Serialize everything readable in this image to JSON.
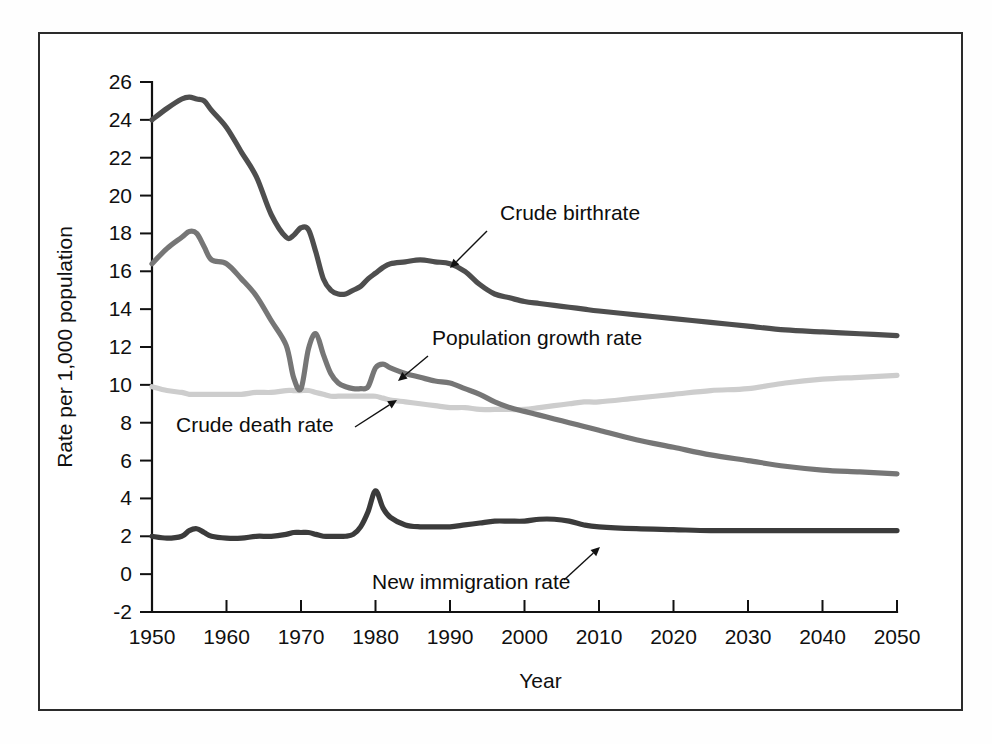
{
  "chart_data": {
    "type": "line",
    "title": "",
    "xlabel": "Year",
    "ylabel": "Rate per 1,000 population",
    "xlim": [
      1950,
      2050
    ],
    "ylim": [
      -2,
      26
    ],
    "grid": false,
    "legend_position": "inline-annotations",
    "xticks": [
      1950,
      1960,
      1970,
      1980,
      1990,
      2000,
      2010,
      2020,
      2030,
      2040,
      2050
    ],
    "xtick_labels": [
      "1950",
      "1960",
      "1970",
      "1980",
      "1990",
      "2000",
      "2010",
      "2020",
      "2030",
      "2040",
      "2050"
    ],
    "yticks": [
      -2,
      0,
      2,
      4,
      6,
      8,
      10,
      12,
      14,
      16,
      18,
      20,
      22,
      24,
      26
    ],
    "ytick_labels": [
      "-2",
      "0",
      "2",
      "4",
      "6",
      "8",
      "10",
      "12",
      "14",
      "16",
      "18",
      "20",
      "22",
      "24",
      "26"
    ],
    "x": [
      1950,
      1952,
      1954,
      1955,
      1956,
      1957,
      1958,
      1960,
      1962,
      1964,
      1966,
      1968,
      1969,
      1970,
      1971,
      1972,
      1973,
      1974,
      1975,
      1976,
      1977,
      1978,
      1979,
      1980,
      1981,
      1982,
      1984,
      1986,
      1988,
      1990,
      1992,
      1994,
      1996,
      1998,
      2000,
      2002,
      2004,
      2006,
      2008,
      2010,
      2015,
      2020,
      2025,
      2030,
      2035,
      2040,
      2045,
      2050
    ],
    "series": [
      {
        "name": "Crude birthrate",
        "color": "#4e4e4e",
        "values": [
          24.0,
          24.6,
          25.1,
          25.2,
          25.1,
          25.0,
          24.5,
          23.6,
          22.3,
          21.0,
          19.0,
          17.8,
          17.9,
          18.3,
          18.2,
          17.0,
          15.6,
          15.0,
          14.8,
          14.8,
          15.0,
          15.2,
          15.6,
          15.9,
          16.2,
          16.4,
          16.5,
          16.6,
          16.5,
          16.4,
          16.0,
          15.3,
          14.8,
          14.6,
          14.4,
          14.3,
          14.2,
          14.1,
          14.0,
          13.9,
          13.7,
          13.5,
          13.3,
          13.1,
          12.9,
          12.8,
          12.7,
          12.6
        ]
      },
      {
        "name": "Population growth rate",
        "color": "#767676",
        "values": [
          16.4,
          17.2,
          17.8,
          18.1,
          18.0,
          17.3,
          16.6,
          16.4,
          15.6,
          14.7,
          13.4,
          12.1,
          10.4,
          9.8,
          11.9,
          12.7,
          11.6,
          10.6,
          10.1,
          9.9,
          9.8,
          9.8,
          9.9,
          10.9,
          11.1,
          10.9,
          10.6,
          10.4,
          10.2,
          10.1,
          9.8,
          9.5,
          9.1,
          8.8,
          8.6,
          8.4,
          8.2,
          8.0,
          7.8,
          7.6,
          7.1,
          6.7,
          6.3,
          6.0,
          5.7,
          5.5,
          5.4,
          5.3
        ]
      },
      {
        "name": "Crude death rate",
        "color": "#cdcdcd",
        "values": [
          9.9,
          9.7,
          9.6,
          9.5,
          9.5,
          9.5,
          9.5,
          9.5,
          9.5,
          9.6,
          9.6,
          9.7,
          9.7,
          9.7,
          9.7,
          9.6,
          9.5,
          9.4,
          9.4,
          9.4,
          9.4,
          9.4,
          9.4,
          9.4,
          9.3,
          9.2,
          9.1,
          9.0,
          8.9,
          8.8,
          8.8,
          8.7,
          8.7,
          8.7,
          8.7,
          8.8,
          8.9,
          9.0,
          9.1,
          9.1,
          9.3,
          9.5,
          9.7,
          9.8,
          10.1,
          10.3,
          10.4,
          10.5
        ]
      },
      {
        "name": "New immigration rate",
        "color": "#3b3b3b",
        "values": [
          2.0,
          1.9,
          2.0,
          2.3,
          2.4,
          2.2,
          2.0,
          1.9,
          1.9,
          2.0,
          2.0,
          2.1,
          2.2,
          2.2,
          2.2,
          2.1,
          2.0,
          2.0,
          2.0,
          2.0,
          2.1,
          2.5,
          3.3,
          4.4,
          3.5,
          3.0,
          2.6,
          2.5,
          2.5,
          2.5,
          2.6,
          2.7,
          2.8,
          2.8,
          2.8,
          2.9,
          2.9,
          2.8,
          2.6,
          2.5,
          2.4,
          2.35,
          2.3,
          2.3,
          2.3,
          2.3,
          2.3,
          2.3
        ]
      }
    ],
    "annotations": [
      {
        "label": "Crude birthrate",
        "label_x": 500,
        "label_y": 220,
        "arrow_from_x": 487,
        "arrow_from_y": 231,
        "arrow_to_x": 450,
        "arrow_to_y": 268
      },
      {
        "label": "Population growth rate",
        "label_x": 432,
        "label_y": 345,
        "arrow_from_x": 428,
        "arrow_from_y": 356,
        "arrow_to_x": 398,
        "arrow_to_y": 381
      },
      {
        "label": "Crude death rate",
        "label_x": 176,
        "label_y": 432,
        "arrow_from_x": 355,
        "arrow_from_y": 427,
        "arrow_to_x": 397,
        "arrow_to_y": 400
      },
      {
        "label": "New immigration rate",
        "label_x": 372,
        "label_y": 589,
        "arrow_from_x": 564,
        "arrow_from_y": 580,
        "arrow_to_x": 600,
        "arrow_to_y": 547
      }
    ]
  },
  "axis": {
    "y_title": "Rate per 1,000 population",
    "x_title": "Year"
  }
}
